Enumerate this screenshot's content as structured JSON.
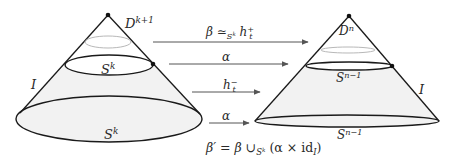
{
  "diagram": {
    "left_cone": {
      "apex_label": "D",
      "apex_label_sup": "k+1",
      "middle_sphere_label": "S",
      "middle_sphere_sup": "k",
      "base_sphere_label": "S",
      "base_sphere_sup": "k",
      "interval_label": "I"
    },
    "right_cone": {
      "apex_label": "D",
      "apex_label_sup": "n",
      "middle_sphere_label": "S",
      "middle_sphere_sup": "n−1",
      "base_sphere_label": "S",
      "base_sphere_sup": "n−1",
      "interval_label": "I"
    },
    "arrows": [
      {
        "label_main": "β ≃",
        "label_sub": "S",
        "label_subsup": "k",
        "label_tail": " h",
        "label_tail_sup": "+",
        "label_tail_sub": "t"
      },
      {
        "label": "α"
      },
      {
        "label": "h",
        "label_sup": "−",
        "label_sub": "t"
      },
      {
        "label": "α"
      }
    ],
    "formula": {
      "lhs": "β′ = β ∪",
      "sub": "S",
      "subsup": "k",
      "rhs_open": " (α × ",
      "id": "id",
      "id_sub": "I",
      "rhs_close": ")"
    },
    "colors": {
      "stroke": "#1a1a1a",
      "fill": "#f1f1f1",
      "faint_ring": "#b8b8b8",
      "arrow": "#555555"
    }
  }
}
